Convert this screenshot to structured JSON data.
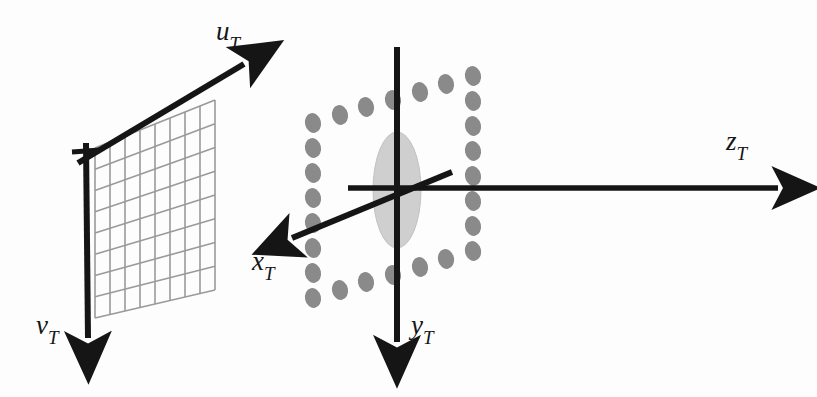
{
  "figure": {
    "background_color": "#fdfdfd",
    "ink_color": "#151515",
    "grid_color": "#9a9a9a",
    "dot_color": "#8a8a8a",
    "lens_color": "#cfcfcf",
    "width": 817,
    "height": 397
  },
  "labels": {
    "u": {
      "base": "u",
      "sub": "T",
      "name": "u-axis-label"
    },
    "v": {
      "base": "v",
      "sub": "T",
      "name": "v-axis-label"
    },
    "x": {
      "base": "x",
      "sub": "T",
      "name": "x-axis-label"
    },
    "y": {
      "base": "y",
      "sub": "T",
      "name": "y-axis-label"
    },
    "z": {
      "base": "z",
      "sub": "T",
      "name": "z-axis-label"
    }
  },
  "image_plane": {
    "name": "image-plane-grid",
    "columns": 8,
    "rows": 8,
    "corners": {
      "top_left": [
        95,
        148
      ],
      "top_right": [
        215,
        100
      ],
      "bottom_right": [
        215,
        290
      ],
      "bottom_left": [
        95,
        318
      ]
    }
  },
  "axes": [
    {
      "name": "u-axis-arrow",
      "from": [
        78,
        163
      ],
      "to": [
        252,
        60
      ],
      "arrow": true
    },
    {
      "name": "v-axis-arrow",
      "from": [
        85,
        143
      ],
      "to": [
        88,
        350
      ],
      "arrow": true
    },
    {
      "name": "x-axis-arrow",
      "from": [
        452,
        172
      ],
      "to": [
        280,
        243
      ],
      "arrow": true
    },
    {
      "name": "y-axis-arrow",
      "from": [
        397,
        47
      ],
      "to": [
        397,
        355
      ],
      "arrow": true
    },
    {
      "name": "z-axis-arrow",
      "from": [
        348,
        188
      ],
      "to": [
        790,
        188
      ],
      "arrow": true
    }
  ],
  "lens": {
    "name": "lens-ellipse",
    "center": [
      397,
      190
    ],
    "rx": 24,
    "ry": 58
  },
  "sensor_frame": {
    "name": "sensor-dot-frame",
    "description": "ring of grey elliptical dots forming a sheared square around the lens",
    "dot_rx": 8,
    "dot_ry": 10,
    "top_row": [
      [
        313,
        123
      ],
      [
        340,
        116
      ],
      [
        367,
        108
      ],
      [
        394,
        100
      ],
      [
        421,
        92
      ],
      [
        448,
        84
      ],
      [
        473,
        76
      ]
    ],
    "bottom_row": [
      [
        313,
        298
      ],
      [
        340,
        291
      ],
      [
        367,
        283
      ],
      [
        394,
        275
      ],
      [
        421,
        267
      ],
      [
        448,
        259
      ],
      [
        473,
        251
      ]
    ],
    "left_col": [
      [
        313,
        123
      ],
      [
        313,
        148
      ],
      [
        313,
        173
      ],
      [
        313,
        198
      ],
      [
        313,
        223
      ],
      [
        313,
        248
      ],
      [
        313,
        273
      ],
      [
        313,
        298
      ]
    ],
    "right_col": [
      [
        473,
        76
      ],
      [
        473,
        101
      ],
      [
        473,
        126
      ],
      [
        473,
        151
      ],
      [
        473,
        176
      ],
      [
        473,
        201
      ],
      [
        473,
        226
      ],
      [
        473,
        251
      ]
    ]
  }
}
